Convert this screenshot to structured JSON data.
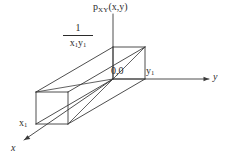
{
  "figure": {
    "background_color": "#ffffff",
    "line_color": "#3a3a3a",
    "text_color": "#2b2b2b",
    "labels": {
      "pdf_base": "p",
      "pdf_subscript": "XY",
      "pdf_args": "(x,y)",
      "height_numerator": "1",
      "height_denominator_x": "x",
      "height_denominator_x_sub": "1",
      "height_denominator_y": "y",
      "height_denominator_y_sub": "1",
      "origin": "0,0",
      "y_tick_base": "y",
      "y_tick_sub": "1",
      "x_tick_base": "x",
      "x_tick_sub": "1",
      "axis_y": "y",
      "axis_x": "x"
    },
    "axes": {
      "vertical_axis": "p_XY(x,y)",
      "horizontal_right_axis": "y",
      "depth_axis": "x"
    },
    "geometry": {
      "box_height_value": "1/(x1*y1)",
      "box_extent_x": "x1",
      "box_extent_y": "y1"
    }
  }
}
